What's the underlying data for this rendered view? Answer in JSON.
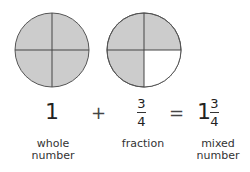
{
  "figure": {
    "circles": [
      {
        "name": "whole",
        "shaded_quarters": [
          true,
          true,
          true,
          true
        ]
      },
      {
        "name": "three-quarters",
        "shaded_quarters": [
          true,
          true,
          false,
          true
        ]
      }
    ],
    "colors": {
      "shade": "#cccccc",
      "empty": "#ffffff",
      "stroke": "#444444"
    }
  },
  "equation": {
    "whole": "1",
    "plus": "+",
    "fraction_num": "3",
    "fraction_den": "4",
    "equals": "=",
    "mixed_whole": "1",
    "mixed_num": "3",
    "mixed_den": "4"
  },
  "labels": {
    "whole_line1": "whole",
    "whole_line2": "number",
    "fraction": "fraction",
    "mixed_line1": "mixed",
    "mixed_line2": "number"
  }
}
